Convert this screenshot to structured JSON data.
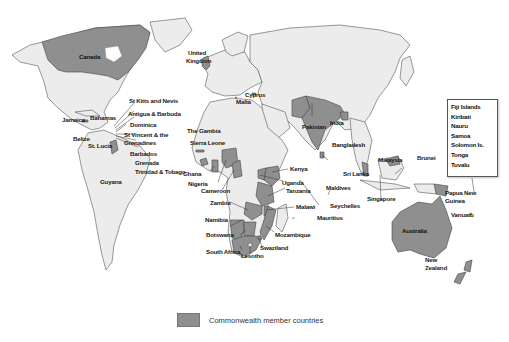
{
  "map": {
    "title": "Commonwealth member countries map",
    "colors": {
      "member": "#8f8f8f",
      "non_member": "#ececec",
      "border": "#555555",
      "ocean": "#ffffff"
    }
  },
  "labels": {
    "canada": "Canada",
    "united_kingdom_1": "United",
    "united_kingdom_2": "Kingdom",
    "cyprus": "Cyprus",
    "malta": "Malta",
    "st_kitts": "St Kitts and Nevis",
    "antigua": "Antigua & Barbuda",
    "dominica": "Dominica",
    "st_vincent_1": "St Vincent & the",
    "st_vincent_2": "Grenadines",
    "barbados": "Barbados",
    "grenada": "Grenada",
    "trinidad": "Trinidad & Tobago",
    "jamaica": "Jamaica",
    "bahamas": "Bahamas",
    "belize": "Belize",
    "st_lucia": "St. Lucia",
    "guyana": "Guyana",
    "the_gambia": "The Gambia",
    "sierra_leone": "Sierra Leone",
    "ghana": "Ghana",
    "nigeria": "Nigeria",
    "cameroon": "Cameroon",
    "zambia": "Zambia",
    "namibia": "Namibia",
    "botswana": "Botswana",
    "south_africa": "South Africa",
    "lesotho": "Lesotho",
    "swaziland": "Swaziland",
    "mozambique": "Mozambique",
    "malawi": "Malawi",
    "tanzania": "Tanzania",
    "uganda": "Uganda",
    "kenya": "Kenya",
    "mauritius": "Mauritius",
    "seychelles": "Seychelles",
    "maldives": "Maldives",
    "sri_lanka": "Sri Lanka",
    "pakistan": "Pakistan",
    "india": "India",
    "bangladesh": "Bangladesh",
    "malaysia": "Malaysia",
    "brunei": "Brunei",
    "singapore": "Singapore",
    "papua_1": "Papua New",
    "papua_2": "Guinea",
    "vanuatu": "Vanuatu",
    "australia": "Australia",
    "new_zealand_1": "New",
    "new_zealand_2": "Zealand"
  },
  "pacific_box": {
    "items": [
      "Fiji Islands",
      "Kiribati",
      "Nauru",
      "Samoa",
      "Solomon Is.",
      "Tonga",
      "Tuvalu"
    ]
  },
  "legend": {
    "label": "Commonwealth member countries"
  }
}
